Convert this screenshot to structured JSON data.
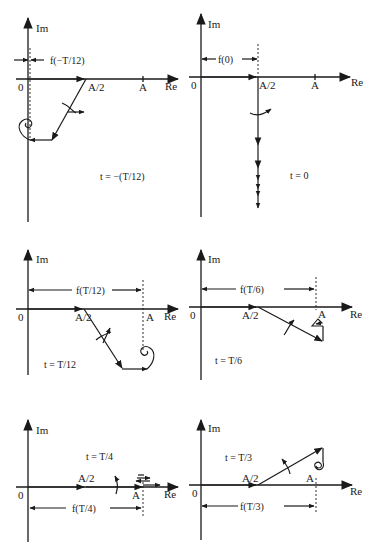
{
  "figure": {
    "axis_labels": {
      "imag": "Im",
      "real": "Re",
      "origin": "0"
    },
    "tick_labels": {
      "half": "A/2",
      "full": "A"
    },
    "panels": [
      {
        "id": "p1",
        "time_label": "t = −(T/12)",
        "measure_label": "f(−T/12)"
      },
      {
        "id": "p2",
        "time_label": "t = 0",
        "measure_label": "f(0)"
      },
      {
        "id": "p3",
        "time_label": "t = T/12",
        "measure_label": "f(T/12)"
      },
      {
        "id": "p4",
        "time_label": "t = T/6",
        "measure_label": "f(T/6)"
      },
      {
        "id": "p5",
        "time_label": "t = T/4",
        "measure_label": "f(T/4)"
      },
      {
        "id": "p6",
        "time_label": "t = T/3",
        "measure_label": "f(T/3)"
      }
    ]
  },
  "colors": {
    "ink": "#1a1a1a",
    "background": "#ffffff"
  }
}
